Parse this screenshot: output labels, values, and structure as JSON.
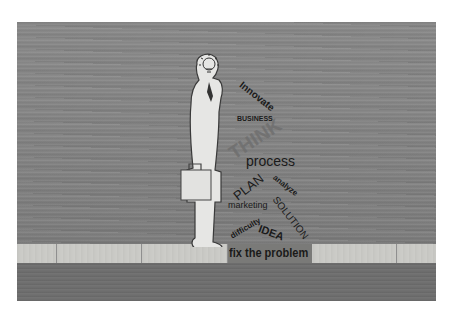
{
  "image": {
    "description": "Paper cut-out silhouette of a businessman holding a briefcase, with a lightbulb head, standing on a wooden surface next to a word cloud",
    "colors": {
      "background": "#ffffff",
      "wood": "#858585",
      "strip": "#cacac6",
      "figure": "#e4e4e2",
      "text": "#1a1a1a"
    }
  },
  "words": {
    "innovate": "Innovate",
    "business": "BUSINESS",
    "think": "THINK",
    "process": "process",
    "analyze": "analyze",
    "plan": "PLAN",
    "marketing": "marketing",
    "solution": "SOLUTION",
    "difficulty": "difficulty",
    "idea": "IDEA",
    "fix": "fix the problem"
  }
}
